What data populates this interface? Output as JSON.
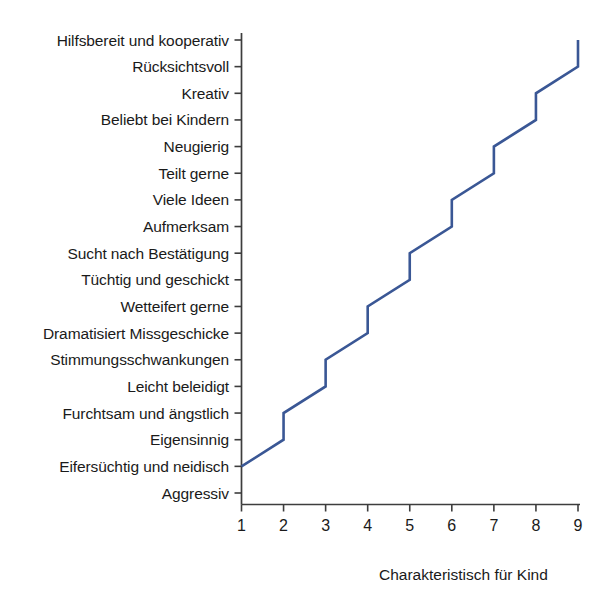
{
  "chart_data": {
    "type": "line",
    "title": "",
    "subtitle": "",
    "xlabel": "Charakteristisch für Kind",
    "ylabel": "",
    "grid": false,
    "legend": "none",
    "line_color": "#3a5795",
    "axis_color": "#3d3d3d",
    "background_color": "#ffffff",
    "xlim": [
      1,
      9
    ],
    "x_ticks": [
      "1",
      "2",
      "3",
      "4",
      "5",
      "6",
      "7",
      "8",
      "9"
    ],
    "x_tick_values": [
      1,
      2,
      3,
      4,
      5,
      6,
      7,
      8,
      9
    ],
    "y_categories": [
      "Hilfsbereit und kooperativ",
      "Rücksichtsvoll",
      "Kreativ",
      "Beliebt bei Kindern",
      "Neugierig",
      "Teilt gerne",
      "Viele Ideen",
      "Aufmerksam",
      "Sucht nach Bestätigung",
      "Tüchtig und geschickt",
      "Wetteifert gerne",
      "Dramatisiert Missgeschicke",
      "Stimmungsschwankungen",
      "Leicht beleidigt",
      "Furchtsam und ängstlich",
      "Eigensinnig",
      "Eifersüchtig und neidisch",
      "Aggressiv"
    ],
    "y_category_indices": [
      17,
      16,
      15,
      14,
      13,
      12,
      11,
      10,
      9,
      8,
      7,
      6,
      5,
      4,
      3,
      2,
      1,
      0
    ],
    "ylim": [
      0,
      17
    ],
    "series": [
      {
        "name": "Charakteristisch für Kind",
        "points": [
          {
            "x": 1,
            "y": 1,
            "y_label": "Eifersüchtig und neidisch"
          },
          {
            "x": 2,
            "y": 2,
            "y_label": "Eigensinnig"
          },
          {
            "x": 2,
            "y": 3,
            "y_label": "Furchtsam und ängstlich"
          },
          {
            "x": 3,
            "y": 4,
            "y_label": "Leicht beleidigt"
          },
          {
            "x": 3,
            "y": 5,
            "y_label": "Stimmungsschwankungen"
          },
          {
            "x": 4,
            "y": 6,
            "y_label": "Dramatisiert Missgeschicke"
          },
          {
            "x": 4,
            "y": 7,
            "y_label": "Wetteifert gerne"
          },
          {
            "x": 5,
            "y": 8,
            "y_label": "Tüchtig und geschickt"
          },
          {
            "x": 5,
            "y": 9,
            "y_label": "Sucht nach Bestätigung"
          },
          {
            "x": 6,
            "y": 10,
            "y_label": "Aufmerksam"
          },
          {
            "x": 6,
            "y": 11,
            "y_label": "Viele Ideen"
          },
          {
            "x": 7,
            "y": 12,
            "y_label": "Teilt gerne"
          },
          {
            "x": 7,
            "y": 13,
            "y_label": "Neugierig"
          },
          {
            "x": 8,
            "y": 14,
            "y_label": "Beliebt bei Kindern"
          },
          {
            "x": 8,
            "y": 15,
            "y_label": "Kreativ"
          },
          {
            "x": 9,
            "y": 16,
            "y_label": "Rücksichtsvoll"
          },
          {
            "x": 9,
            "y": 17,
            "y_label": "Hilfsbereit und kooperativ"
          }
        ]
      }
    ]
  }
}
